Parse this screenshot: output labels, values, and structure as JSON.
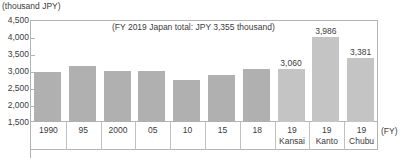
{
  "chart_data": {
    "type": "bar",
    "title": "",
    "unit_label": "(thousand JPY)",
    "annotation": "(FY 2019 Japan total: JPY 3,355 thousand)",
    "xlabel": "(FY)",
    "ylabel": "",
    "ylim": [
      1500,
      4500
    ],
    "yticks": [
      1500,
      2000,
      2500,
      3000,
      3500,
      4000,
      4500
    ],
    "ytick_labels": [
      "1,500",
      "2,000",
      "2,500",
      "3,000",
      "3,500",
      "4,000",
      "4,500"
    ],
    "grid": true,
    "legend": "none",
    "categories": [
      "1990",
      "95",
      "2000",
      "05",
      "10",
      "15",
      "18",
      "19 Kansai",
      "19 Kanto",
      "19 Chubu"
    ],
    "category_lines": [
      [
        "1990",
        ""
      ],
      [
        "95",
        ""
      ],
      [
        "2000",
        ""
      ],
      [
        "05",
        ""
      ],
      [
        "10",
        ""
      ],
      [
        "15",
        ""
      ],
      [
        "18",
        ""
      ],
      [
        "19",
        "Kansai"
      ],
      [
        "19",
        "Kanto"
      ],
      [
        "19",
        "Chubu"
      ]
    ],
    "values": [
      2970,
      3150,
      3010,
      3000,
      2730,
      2890,
      3050,
      3060,
      3986,
      3381
    ],
    "value_labels": [
      "",
      "",
      "",
      "",
      "",
      "",
      "",
      "3,060",
      "3,986",
      "3,381"
    ],
    "bar_styles": [
      "dark",
      "dark",
      "dark",
      "dark",
      "dark",
      "dark",
      "dark",
      "light",
      "light",
      "light"
    ],
    "colors": {
      "bar_dark": "#b0b0b0",
      "bar_light": "#c4c4c4",
      "axis": "#b4b4b4",
      "text": "#3c3c3c",
      "background": "#ffffff"
    }
  }
}
